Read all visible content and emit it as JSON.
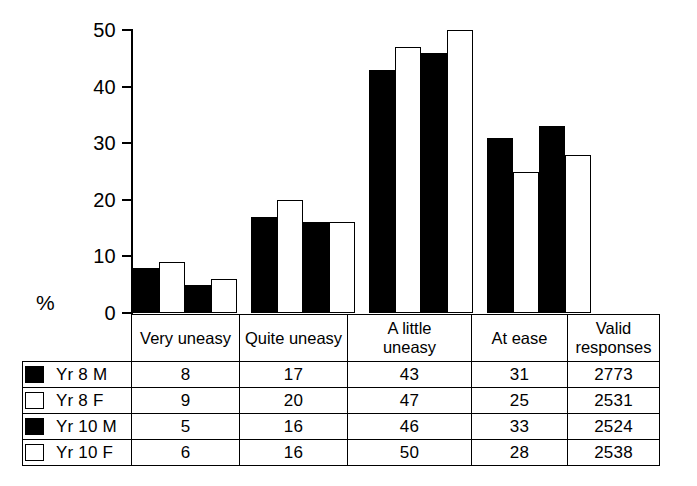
{
  "chart_data": {
    "type": "bar",
    "title": "",
    "xlabel": "",
    "ylabel": "%",
    "ylim": [
      0,
      50
    ],
    "yticks": [
      0,
      10,
      20,
      30,
      40,
      50
    ],
    "grid": false,
    "legend_position": "table-left-column",
    "categories": [
      "Very uneasy",
      "Quite uneasy",
      "A little uneasy",
      "At ease"
    ],
    "series": [
      {
        "name": "Yr 8 M",
        "values": [
          8,
          17,
          43,
          31
        ],
        "fill": "black",
        "valid_responses": 2773
      },
      {
        "name": "Yr 8 F",
        "values": [
          9,
          20,
          47,
          25
        ],
        "fill": "white",
        "valid_responses": 2531
      },
      {
        "name": "Yr 10 M",
        "values": [
          5,
          16,
          46,
          33
        ],
        "fill": "black",
        "valid_responses": 2524
      },
      {
        "name": "Yr 10 F",
        "values": [
          6,
          16,
          50,
          28
        ],
        "fill": "white",
        "valid_responses": 2538
      }
    ]
  },
  "axis": {
    "y_label": "%",
    "ticks": [
      {
        "label": "50"
      },
      {
        "label": "40"
      },
      {
        "label": "30"
      },
      {
        "label": "20"
      },
      {
        "label": "10"
      },
      {
        "label": "0"
      }
    ]
  },
  "table": {
    "headers": [
      "Very uneasy",
      "Quite uneasy",
      "A little uneasy",
      "At ease",
      "Valid responses"
    ],
    "header_lines": [
      [
        "Very uneasy"
      ],
      [
        "Quite uneasy"
      ],
      [
        "A little",
        "uneasy"
      ],
      [
        "At ease"
      ],
      [
        "Valid",
        "responses"
      ]
    ],
    "rows": [
      {
        "legend": "Yr 8 M",
        "swatch": "filled",
        "cells": [
          "8",
          "17",
          "43",
          "31",
          "2773"
        ]
      },
      {
        "legend": "Yr 8 F",
        "swatch": "hollow",
        "cells": [
          "9",
          "20",
          "47",
          "25",
          "2531"
        ]
      },
      {
        "legend": "Yr 10 M",
        "swatch": "filled",
        "cells": [
          "5",
          "16",
          "46",
          "33",
          "2524"
        ]
      },
      {
        "legend": "Yr 10 F",
        "swatch": "hollow",
        "cells": [
          "6",
          "16",
          "50",
          "28",
          "2538"
        ]
      }
    ]
  },
  "colors": {
    "ink": "#000000",
    "paper": "#ffffff",
    "series_filled": "#000000",
    "series_hollow": "#ffffff"
  }
}
